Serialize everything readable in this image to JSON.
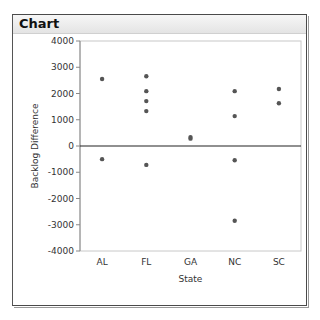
{
  "window": {
    "title": "Chart"
  },
  "chart_data": {
    "type": "scatter",
    "title": "",
    "xlabel": "State",
    "ylabel": "Backlog Difference",
    "categories": [
      "AL",
      "FL",
      "GA",
      "NC",
      "SC"
    ],
    "ylim": [
      -4000,
      4000
    ],
    "yticks": [
      4000,
      3000,
      2000,
      1000,
      0,
      -1000,
      -2000,
      -3000,
      -4000
    ],
    "reference_line": 0,
    "grid": false,
    "legend": null,
    "points": [
      {
        "x": "AL",
        "y": 2550
      },
      {
        "x": "AL",
        "y": -500
      },
      {
        "x": "FL",
        "y": 2660
      },
      {
        "x": "FL",
        "y": 2090
      },
      {
        "x": "FL",
        "y": 1710
      },
      {
        "x": "FL",
        "y": 1330
      },
      {
        "x": "FL",
        "y": -720
      },
      {
        "x": "GA",
        "y": 340
      },
      {
        "x": "GA",
        "y": 280
      },
      {
        "x": "NC",
        "y": 2090
      },
      {
        "x": "NC",
        "y": 1140
      },
      {
        "x": "NC",
        "y": -540
      },
      {
        "x": "NC",
        "y": -2850
      },
      {
        "x": "SC",
        "y": 2170
      },
      {
        "x": "SC",
        "y": 1630
      }
    ],
    "point_color": "#555555"
  }
}
